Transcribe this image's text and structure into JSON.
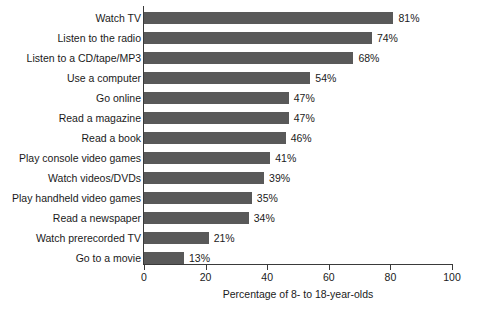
{
  "chart_data": {
    "type": "bar",
    "orientation": "horizontal",
    "title": "",
    "xlabel": "Percentage of 8- to 18-year-olds",
    "ylabel": "",
    "xlim": [
      0,
      100
    ],
    "xticks": [
      0,
      20,
      40,
      60,
      80,
      100
    ],
    "xtick_labels": [
      "0",
      "20",
      "40",
      "60",
      "80",
      "100"
    ],
    "grid": false,
    "legend": false,
    "bar_color": "#595959",
    "axis_color": "#3a3a3a",
    "value_suffix": "%",
    "categories": [
      "Watch TV",
      "Listen to the radio",
      "Listen to a CD/tape/MP3",
      "Use a computer",
      "Go online",
      "Read a magazine",
      "Read a book",
      "Play console video games",
      "Watch videos/DVDs",
      "Play handheld video games",
      "Read a newspaper",
      "Watch prerecorded TV",
      "Go to a movie"
    ],
    "values": [
      81,
      74,
      68,
      54,
      47,
      47,
      46,
      41,
      39,
      35,
      34,
      21,
      13
    ],
    "value_labels": [
      "81%",
      "74%",
      "68%",
      "54%",
      "47%",
      "47%",
      "46%",
      "41%",
      "39%",
      "35%",
      "34%",
      "21%",
      "13%"
    ]
  }
}
